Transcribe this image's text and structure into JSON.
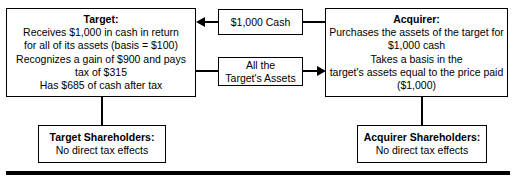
{
  "diagram": {
    "colors": {
      "line": "#000000",
      "box_border": "#000000",
      "background": "#ffffff",
      "text": "#000000"
    },
    "nodes": {
      "target": {
        "title": "Target:",
        "lines": [
          "Receives $1,000 in cash in return",
          "for all of its assets (basis = $100)",
          "Recognizes a gain of $900 and pays",
          "tax of $315",
          "Has $685 of cash after tax"
        ]
      },
      "acquirer": {
        "title": "Acquirer:",
        "lines": [
          "Purchases the assets of the target for",
          "$1,000 cash",
          "Takes a basis in the",
          "target's assets equal to the price paid",
          "($1,000)"
        ]
      },
      "target_shareholders": {
        "title": "Target Shareholders:",
        "lines": [
          "No direct tax effects"
        ]
      },
      "acquirer_shareholders": {
        "title": "Acquirer Shareholders:",
        "lines": [
          "No direct tax effects"
        ]
      }
    },
    "flows": {
      "cash": {
        "lines": [
          "$1,000 Cash"
        ],
        "direction": "right-to-left",
        "from": "Acquirer",
        "to": "Target",
        "arrow_glyph": "left-arrowhead"
      },
      "assets": {
        "lines": [
          "All the",
          "Target's Assets"
        ],
        "direction": "left-to-right",
        "from": "Target",
        "to": "Acquirer",
        "arrow_glyph": "right-arrowhead"
      }
    }
  }
}
